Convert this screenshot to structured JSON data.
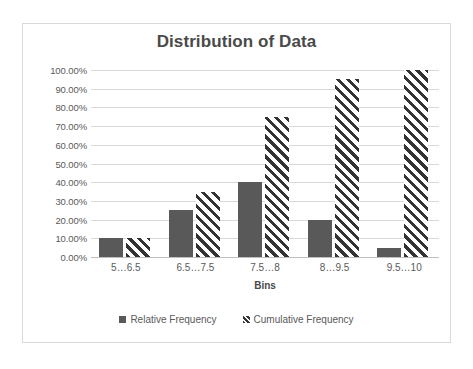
{
  "chart_data": {
    "type": "bar",
    "title": "Distribution of Data",
    "xlabel": "Bins",
    "ylabel": "",
    "categories": [
      "5…6.5",
      "6.5…7.5",
      "7.5…8",
      "8…9.5",
      "9.5…10"
    ],
    "series": [
      {
        "name": "Relative Frequency",
        "values": [
          10,
          25,
          40,
          20,
          5
        ],
        "style": "solid",
        "color": "#595959"
      },
      {
        "name": "Cumulative Frequency",
        "values": [
          10,
          35,
          75,
          95,
          100
        ],
        "style": "diagonal-hatch",
        "color": "#333333"
      }
    ],
    "ylim": [
      0,
      100
    ],
    "y_ticks": [
      "0.00%",
      "10.00%",
      "20.00%",
      "30.00%",
      "40.00%",
      "50.00%",
      "60.00%",
      "70.00%",
      "80.00%",
      "90.00%",
      "100.00%"
    ],
    "y_tick_values": [
      0,
      10,
      20,
      30,
      40,
      50,
      60,
      70,
      80,
      90,
      100
    ],
    "grid": true,
    "legend_position": "bottom",
    "value_suffix": "%"
  },
  "legend": {
    "items": [
      {
        "label": "Relative Frequency",
        "swatch": "solid-square-marker"
      },
      {
        "label": "Cumulative Frequency",
        "swatch": "hatched-square-marker"
      }
    ]
  },
  "colors": {
    "relative_frequency": "#595959",
    "cumulative_frequency": "#333333",
    "gridline": "#d9d9d9",
    "frame_border": "#d9d9d9",
    "title_text": "#4a4a4a",
    "axis_text": "#5a5a5a",
    "background": "#ffffff"
  }
}
